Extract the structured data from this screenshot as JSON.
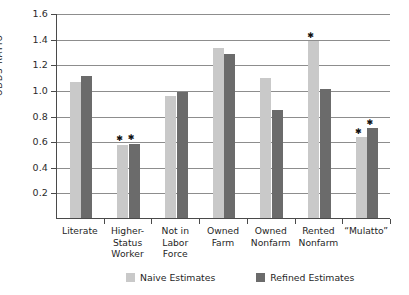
{
  "chart_data": {
    "type": "bar",
    "title": "",
    "xlabel": "",
    "ylabel": "ODDS RATIO",
    "ylim": [
      0,
      1.6
    ],
    "ytick_step": 0.2,
    "grid": true,
    "legend_position": "bottom",
    "categories": [
      "Literate",
      "Higher-\nStatus\nWorker",
      "Not in\nLabor\nForce",
      "Owned\nFarm",
      "Owned\nNonfarm",
      "Rented\nNonfarm",
      "“Mulatto”"
    ],
    "series": [
      {
        "name": "Naive Estimates",
        "color": "#c9c9c9",
        "values": [
          1.06,
          0.57,
          0.95,
          1.33,
          1.09,
          1.38,
          0.63
        ]
      },
      {
        "name": "Refined Estimates",
        "color": "#6b6b6b",
        "values": [
          1.11,
          0.58,
          0.98,
          1.28,
          0.84,
          1.01,
          0.7
        ]
      }
    ],
    "annotations": [
      {
        "category": "Higher-\nStatus\nWorker",
        "series": "Naive Estimates",
        "marker": "*"
      },
      {
        "category": "Higher-\nStatus\nWorker",
        "series": "Refined Estimates",
        "marker": "*"
      },
      {
        "category": "Rented\nNonfarm",
        "series": "Naive Estimates",
        "marker": "*"
      },
      {
        "category": "“Mulatto”",
        "series": "Naive Estimates",
        "marker": "*"
      },
      {
        "category": "“Mulatto”",
        "series": "Refined Estimates",
        "marker": "*"
      }
    ],
    "ytick_labels": [
      "1.6",
      "1.4",
      "1.2",
      "1.0",
      "0.8",
      "0.6",
      "0.4",
      "0.2"
    ],
    "ytick_values": [
      1.6,
      1.4,
      1.2,
      1.0,
      0.8,
      0.6,
      0.4,
      0.2
    ]
  },
  "legend": {
    "items": [
      {
        "label": "Naive Estimates",
        "key": "naive"
      },
      {
        "label": "Refined Estimates",
        "key": "refined"
      }
    ]
  }
}
